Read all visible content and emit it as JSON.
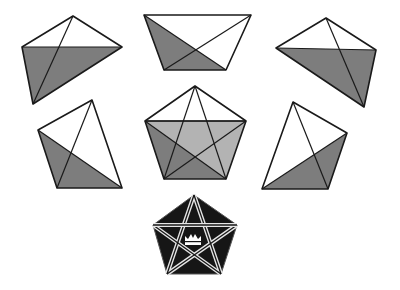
{
  "diagram": {
    "colors": {
      "background": "#ffffff",
      "stroke": "#1a1a1a",
      "shade_dark": "#7d7d7d",
      "shade_light": "#b3b3b3",
      "emblem_fill": "#161616",
      "emblem_lines": "#e6e6e6"
    },
    "pieces": [
      {
        "id": "piece-top-left",
        "outline": [
          [
            73,
            16
          ],
          [
            122,
            47
          ],
          [
            33,
            104
          ],
          [
            22,
            47
          ]
        ],
        "shaded": [
          [
            22,
            47
          ],
          [
            122,
            47
          ],
          [
            33,
            104
          ]
        ],
        "lines": [
          [
            [
              73,
              16
            ],
            [
              33,
              104
            ]
          ],
          [
            [
              22,
              47
            ],
            [
              122,
              47
            ]
          ]
        ]
      },
      {
        "id": "piece-top-center",
        "outline": [
          [
            144,
            15
          ],
          [
            251,
            15
          ],
          [
            226,
            70
          ],
          [
            164,
            70
          ]
        ],
        "shaded": [
          [
            144,
            15
          ],
          [
            164,
            70
          ],
          [
            226,
            70
          ]
        ],
        "lines": [
          [
            [
              144,
              15
            ],
            [
              226,
              70
            ]
          ],
          [
            [
              251,
              15
            ],
            [
              164,
              70
            ]
          ]
        ]
      },
      {
        "id": "piece-top-right",
        "outline": [
          [
            326,
            18
          ],
          [
            376,
            50
          ],
          [
            364,
            107
          ],
          [
            276,
            48
          ]
        ],
        "shaded": [
          [
            276,
            48
          ],
          [
            376,
            50
          ],
          [
            364,
            107
          ]
        ],
        "lines": [
          [
            [
              326,
              18
            ],
            [
              364,
              107
            ]
          ],
          [
            [
              276,
              48
            ],
            [
              376,
              50
            ]
          ]
        ]
      },
      {
        "id": "piece-middle-left",
        "outline": [
          [
            92,
            100
          ],
          [
            122,
            188
          ],
          [
            57,
            188
          ],
          [
            38,
            130
          ]
        ],
        "shaded": [
          [
            38,
            130
          ],
          [
            57,
            188
          ],
          [
            122,
            188
          ]
        ],
        "lines": [
          [
            [
              92,
              100
            ],
            [
              57,
              188
            ]
          ],
          [
            [
              38,
              130
            ],
            [
              122,
              188
            ]
          ]
        ]
      },
      {
        "id": "piece-middle-right",
        "outline": [
          [
            293,
            102
          ],
          [
            347,
            133
          ],
          [
            328,
            189
          ],
          [
            262,
            189
          ]
        ],
        "shaded": [
          [
            347,
            133
          ],
          [
            328,
            189
          ],
          [
            262,
            189
          ]
        ],
        "lines": [
          [
            [
              293,
              102
            ],
            [
              328,
              189
            ]
          ],
          [
            [
              347,
              133
            ],
            [
              262,
              189
            ]
          ]
        ]
      }
    ],
    "assembled_pentagon": {
      "id": "assembled-pentagon",
      "vertices": [
        [
          195,
          86
        ],
        [
          246,
          121
        ],
        [
          226,
          179
        ],
        [
          164,
          179
        ],
        [
          145,
          121
        ]
      ],
      "light_region": [
        [
          145,
          121
        ],
        [
          246,
          121
        ],
        [
          226,
          179
        ],
        [
          164,
          179
        ]
      ],
      "dark_region": [
        [
          145,
          121
        ],
        [
          164,
          179
        ],
        [
          226,
          179
        ]
      ]
    },
    "emblem": {
      "id": "pentagram-emblem",
      "vertices": [
        [
          194,
          195
        ],
        [
          237,
          225
        ],
        [
          221,
          274
        ],
        [
          167,
          274
        ],
        [
          153,
          225
        ]
      ],
      "crown_center": [
        193,
        239
      ]
    }
  }
}
